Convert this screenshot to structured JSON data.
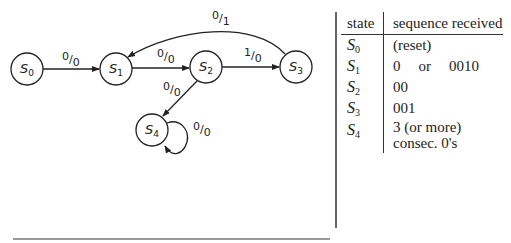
{
  "diagram": {
    "type": "state-machine",
    "states": [
      {
        "id": "S0",
        "base": "S",
        "sub": "0"
      },
      {
        "id": "S1",
        "base": "S",
        "sub": "1"
      },
      {
        "id": "S2",
        "base": "S",
        "sub": "2"
      },
      {
        "id": "S3",
        "base": "S",
        "sub": "3"
      },
      {
        "id": "S4",
        "base": "S",
        "sub": "4"
      }
    ],
    "transitions": [
      {
        "from": "S0",
        "to": "S1",
        "input": "0",
        "output": "0"
      },
      {
        "from": "S1",
        "to": "S2",
        "input": "0",
        "output": "0"
      },
      {
        "from": "S2",
        "to": "S3",
        "input": "1",
        "output": "0"
      },
      {
        "from": "S3",
        "to": "S1",
        "input": "0",
        "output": "1"
      },
      {
        "from": "S2",
        "to": "S4",
        "input": "0",
        "output": "0"
      },
      {
        "from": "S4",
        "to": "S4",
        "input": "0",
        "output": "0"
      }
    ]
  },
  "table": {
    "header_state": "state",
    "header_sequence": "sequence received",
    "rows": [
      {
        "state": "S",
        "sub": "0",
        "seq": "(reset)"
      },
      {
        "state": "S",
        "sub": "1",
        "seq_a": "0",
        "seq_or": "or",
        "seq_b": "0010"
      },
      {
        "state": "S",
        "sub": "2",
        "seq": "00"
      },
      {
        "state": "S",
        "sub": "3",
        "seq": "001"
      },
      {
        "state": "S",
        "sub": "4",
        "seq_line1": "3 (or more)",
        "seq_line2": "consec. 0's"
      }
    ]
  }
}
